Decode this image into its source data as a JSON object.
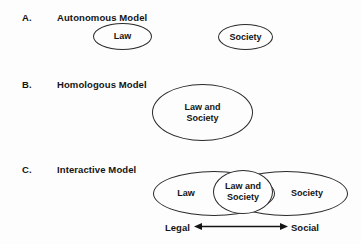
{
  "figure": {
    "background_color": "#fdfdfd",
    "stroke_color": "#2a2a2a",
    "text_color": "#141414",
    "panels": [
      {
        "letter": "A.",
        "title": "Autonomous Model",
        "shapes": [
          {
            "label": "Law",
            "kind": "ellipse"
          },
          {
            "label": "Society",
            "kind": "ellipse"
          }
        ]
      },
      {
        "letter": "B.",
        "title": "Homologous Model",
        "shapes": [
          {
            "label": "Law and\nSociety",
            "kind": "ellipse"
          }
        ]
      },
      {
        "letter": "C.",
        "title": "Interactive Model",
        "shapes": [
          {
            "label": "Law",
            "kind": "ellipse"
          },
          {
            "label": "Law and\nSociety",
            "kind": "ellipse"
          },
          {
            "label": "Society",
            "kind": "ellipse"
          }
        ],
        "axis": {
          "left_label": "Legal",
          "right_label": "Social",
          "arrow": "double-headed-arrow"
        }
      }
    ]
  }
}
